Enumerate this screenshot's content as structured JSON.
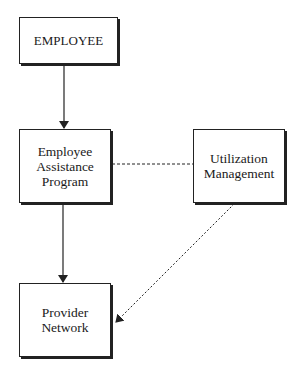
{
  "diagram": {
    "nodes": {
      "employee": {
        "label": "EMPLOYEE"
      },
      "eap": {
        "label": "Employee\nAssistance\nProgram"
      },
      "utilization": {
        "label": "Utilization\nManagement"
      },
      "provider": {
        "label": "Provider\nNetwork"
      }
    },
    "edges": [
      {
        "from": "EMPLOYEE",
        "to": "Employee Assistance Program",
        "style": "solid",
        "arrow": true
      },
      {
        "from": "Employee Assistance Program",
        "to": "Provider Network",
        "style": "solid",
        "arrow": true
      },
      {
        "from": "Employee Assistance Program",
        "to": "Utilization Management",
        "style": "dashed",
        "arrow": false
      },
      {
        "from": "Utilization Management",
        "to": "Provider Network",
        "style": "dotted",
        "arrow": true
      }
    ]
  }
}
